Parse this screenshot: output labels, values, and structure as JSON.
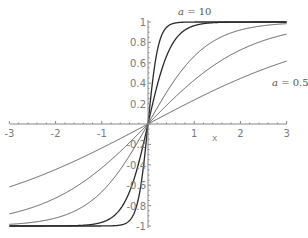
{
  "chart_data": {
    "type": "line",
    "title": "",
    "xlabel": "x",
    "ylabel": "",
    "xlim": [
      -3,
      3
    ],
    "ylim": [
      -1,
      1
    ],
    "grid": false,
    "legend": "none",
    "x_ticks": [
      -3,
      -2,
      -1,
      1,
      2,
      3
    ],
    "x_tick_labels": [
      "-3",
      "-2",
      "-1",
      "1",
      "2",
      "3"
    ],
    "y_ticks": [
      1,
      0.8,
      0.6,
      0.4,
      0.2,
      -0.2,
      -0.4,
      -0.6,
      -0.8,
      -1
    ],
    "y_tick_labels": [
      "1",
      "0.8",
      "0.6",
      "0.4",
      "0.2",
      "-0.2",
      "-0.4",
      "-0.6",
      "-0.8",
      "-1"
    ],
    "annotations": [
      {
        "text": "a = 10",
        "near": "steepest curve, top"
      },
      {
        "text": "a = 0.5",
        "near": "shallowest curve, right"
      }
    ],
    "series": [
      {
        "name": "a = 0.5",
        "k": 0.24,
        "value_at_x3": 0.61,
        "value_at_xm3": -0.61
      },
      {
        "name": "curve 2",
        "k": 0.46,
        "value_at_x3": 0.88,
        "value_at_xm3": -0.88
      },
      {
        "name": "curve 3",
        "k": 0.8,
        "value_at_x3": 0.98,
        "value_at_xm3": -0.98
      },
      {
        "name": "curve 4",
        "k": 2.0,
        "value_at_x3": 1.0,
        "value_at_xm3": -1.0
      },
      {
        "name": "a = 10",
        "k": 4.5,
        "value_at_x3": 1.0,
        "value_at_xm3": -1.0
      }
    ],
    "curve_shape": "odd sigmoid, approx tanh(k*x)"
  },
  "labels": {
    "xaxis": "x",
    "annot_top_var": "a",
    "annot_top_rest": " = 10",
    "annot_right_var": "a",
    "annot_right_rest": " = 0.5"
  }
}
